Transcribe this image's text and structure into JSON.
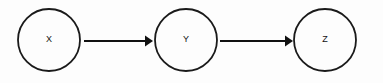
{
  "diagram": {
    "type": "directed-graph",
    "background_color": "#fdfdfd",
    "stroke_color": "#1a1a1a",
    "label_color": "#111111",
    "nodes": [
      {
        "id": "x",
        "label": "X",
        "shape": "circle",
        "cx": 49,
        "cy": 40,
        "r": 31
      },
      {
        "id": "y",
        "label": "Y",
        "shape": "circle",
        "cx": 186,
        "cy": 40,
        "r": 31
      },
      {
        "id": "z",
        "label": "Z",
        "shape": "circle",
        "cx": 325,
        "cy": 40,
        "r": 31
      }
    ],
    "edges": [
      {
        "id": "x-to-y",
        "from": "X",
        "to": "Y",
        "x1": 84,
        "x2": 152,
        "y": 41,
        "arrowhead": "solid-triangle"
      },
      {
        "id": "y-to-z",
        "from": "Y",
        "to": "Z",
        "x1": 220,
        "x2": 292,
        "y": 41,
        "arrowhead": "solid-triangle"
      }
    ]
  }
}
